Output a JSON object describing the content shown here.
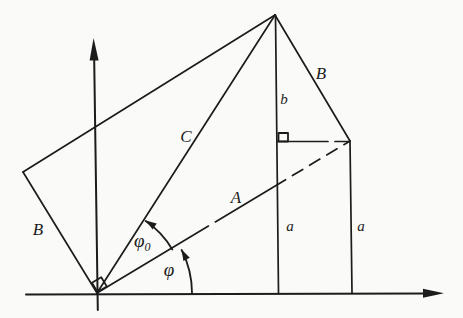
{
  "figure": {
    "background": "#fafaf8",
    "ink": "#1c1c1c",
    "labels": {
      "side_b_left": "B",
      "side_b_right": "B",
      "diagonal_c": "C",
      "vector_a": "A",
      "segment_b": "b",
      "segment_a_left": "a",
      "segment_a_right": "a",
      "angle_phi": "φ",
      "angle_phi0_base": "φ",
      "angle_phi0_sub": "0"
    }
  }
}
